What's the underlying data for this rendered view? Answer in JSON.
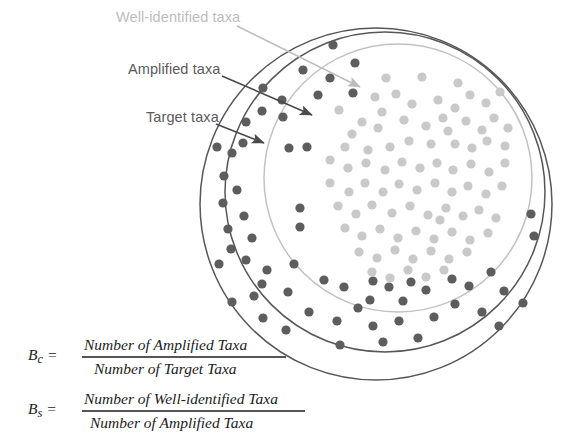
{
  "figure": {
    "type": "venn-nested-circles-diagram",
    "background": "#ffffff"
  },
  "labels": [
    {
      "id": "well-identified",
      "text": "Well-identified taxa",
      "color": "#bdbdbd",
      "x": 116,
      "y": 22,
      "arrow": {
        "x1": 237,
        "y1": 26,
        "x2": 360,
        "y2": 87,
        "color": "#bdbdbd"
      }
    },
    {
      "id": "amplified",
      "text": "Amplified taxa",
      "color": "#5b5b5b",
      "x": 128,
      "y": 74,
      "arrow": {
        "x1": 222,
        "y1": 76,
        "x2": 312,
        "y2": 115,
        "color": "#4a4a4a"
      }
    },
    {
      "id": "target",
      "text": "Target taxa",
      "color": "#5b5b5b",
      "x": 146,
      "y": 122,
      "arrow": {
        "x1": 216,
        "y1": 124,
        "x2": 264,
        "y2": 143,
        "color": "#4a4a4a"
      }
    }
  ],
  "circles": [
    {
      "id": "target-circle",
      "name": "Target taxa",
      "cx": 376,
      "cy": 204,
      "r": 176,
      "stroke": "#575757",
      "stroke_width": 1.5,
      "fill": "none"
    },
    {
      "id": "amplified-circle",
      "name": "Amplified taxa",
      "cx": 385,
      "cy": 192,
      "r": 160,
      "stroke": "#575757",
      "stroke_width": 1.5,
      "fill": "none"
    },
    {
      "id": "well-identified-circle",
      "name": "Well-identified taxa",
      "cx": 398,
      "cy": 178,
      "r": 134,
      "stroke": "#c2c2c2",
      "stroke_width": 1.5,
      "fill": "none"
    }
  ],
  "dot_styles": {
    "outer": {
      "color": "#5d5d5d",
      "radius": 4.6
    },
    "inner": {
      "color": "#c9c9c9",
      "radius": 4.6
    }
  },
  "chart_data": {
    "type": "scatter",
    "title": "",
    "outer_ring_dot_count": 62,
    "inner_dot_count": 86,
    "outer_dots": [
      [
        333,
        45
      ],
      [
        355,
        63
      ],
      [
        303,
        70
      ],
      [
        330,
        78
      ],
      [
        263,
        88
      ],
      [
        318,
        95
      ],
      [
        353,
        93
      ],
      [
        282,
        100
      ],
      [
        262,
        111
      ],
      [
        246,
        122
      ],
      [
        283,
        117
      ],
      [
        243,
        143
      ],
      [
        232,
        153
      ],
      [
        217,
        147
      ],
      [
        289,
        148
      ],
      [
        307,
        147
      ],
      [
        224,
        176
      ],
      [
        237,
        190
      ],
      [
        223,
        203
      ],
      [
        244,
        216
      ],
      [
        228,
        229
      ],
      [
        300,
        208
      ],
      [
        300,
        227
      ],
      [
        252,
        238
      ],
      [
        231,
        249
      ],
      [
        246,
        260
      ],
      [
        219,
        264
      ],
      [
        267,
        270
      ],
      [
        294,
        264
      ],
      [
        262,
        284
      ],
      [
        254,
        296
      ],
      [
        288,
        292
      ],
      [
        324,
        280
      ],
      [
        344,
        287
      ],
      [
        373,
        281
      ],
      [
        389,
        287
      ],
      [
        411,
        282
      ],
      [
        426,
        290
      ],
      [
        370,
        300
      ],
      [
        403,
        301
      ],
      [
        452,
        279
      ],
      [
        469,
        286
      ],
      [
        491,
        272
      ],
      [
        504,
        291
      ],
      [
        523,
        303
      ],
      [
        531,
        214
      ],
      [
        534,
        236
      ],
      [
        309,
        312
      ],
      [
        337,
        321
      ],
      [
        358,
        308
      ],
      [
        373,
        326
      ],
      [
        399,
        321
      ],
      [
        434,
        317
      ],
      [
        455,
        304
      ],
      [
        482,
        312
      ],
      [
        499,
        326
      ],
      [
        340,
        345
      ],
      [
        383,
        342
      ],
      [
        418,
        338
      ],
      [
        263,
        318
      ],
      [
        286,
        330
      ],
      [
        232,
        302
      ]
    ],
    "inner_dots": [
      [
        386,
        78
      ],
      [
        422,
        77
      ],
      [
        458,
        83
      ],
      [
        375,
        97
      ],
      [
        382,
        112
      ],
      [
        396,
        94
      ],
      [
        412,
        104
      ],
      [
        438,
        100
      ],
      [
        455,
        108
      ],
      [
        470,
        95
      ],
      [
        486,
        103
      ],
      [
        500,
        92
      ],
      [
        339,
        110
      ],
      [
        362,
        122
      ],
      [
        352,
        134
      ],
      [
        378,
        128
      ],
      [
        404,
        120
      ],
      [
        426,
        126
      ],
      [
        448,
        131
      ],
      [
        443,
        118
      ],
      [
        466,
        121
      ],
      [
        482,
        130
      ],
      [
        494,
        118
      ],
      [
        508,
        128
      ],
      [
        487,
        141
      ],
      [
        505,
        146
      ],
      [
        472,
        148
      ],
      [
        455,
        144
      ],
      [
        431,
        144
      ],
      [
        409,
        141
      ],
      [
        390,
        147
      ],
      [
        368,
        150
      ],
      [
        345,
        147
      ],
      [
        330,
        160
      ],
      [
        348,
        168
      ],
      [
        366,
        163
      ],
      [
        385,
        170
      ],
      [
        402,
        162
      ],
      [
        420,
        168
      ],
      [
        437,
        163
      ],
      [
        453,
        170
      ],
      [
        471,
        164
      ],
      [
        489,
        172
      ],
      [
        505,
        163
      ],
      [
        330,
        183
      ],
      [
        349,
        192
      ],
      [
        365,
        183
      ],
      [
        383,
        192
      ],
      [
        399,
        184
      ],
      [
        417,
        190
      ],
      [
        435,
        183
      ],
      [
        452,
        192
      ],
      [
        468,
        186
      ],
      [
        486,
        194
      ],
      [
        502,
        186
      ],
      [
        338,
        206
      ],
      [
        356,
        214
      ],
      [
        372,
        205
      ],
      [
        392,
        213
      ],
      [
        410,
        206
      ],
      [
        428,
        215
      ],
      [
        446,
        208
      ],
      [
        463,
        216
      ],
      [
        440,
        220
      ],
      [
        479,
        210
      ],
      [
        496,
        218
      ],
      [
        345,
        228
      ],
      [
        362,
        236
      ],
      [
        380,
        229
      ],
      [
        398,
        238
      ],
      [
        416,
        231
      ],
      [
        434,
        239
      ],
      [
        452,
        232
      ],
      [
        470,
        240
      ],
      [
        488,
        233
      ],
      [
        359,
        252
      ],
      [
        377,
        258
      ],
      [
        395,
        250
      ],
      [
        413,
        259
      ],
      [
        431,
        251
      ],
      [
        449,
        259
      ],
      [
        467,
        252
      ],
      [
        372,
        272
      ],
      [
        390,
        278
      ],
      [
        408,
        270
      ],
      [
        426,
        277
      ],
      [
        444,
        270
      ]
    ]
  },
  "formulas": [
    {
      "id": "bc",
      "lhs_main": "B",
      "lhs_sub": "c",
      "equals": "=",
      "numerator": "Number of Amplified Taxa",
      "denominator": "Number of Target Taxa"
    },
    {
      "id": "bs",
      "lhs_main": "B",
      "lhs_sub": "s",
      "equals": "=",
      "numerator": "Number of Well-identified Taxa",
      "denominator": "Number of Amplified Taxa"
    }
  ]
}
